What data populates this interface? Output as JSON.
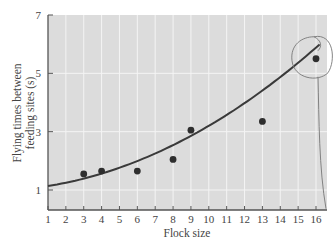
{
  "chart_data": {
    "type": "scatter",
    "title": "",
    "xlabel": "Flock size",
    "ylabel": "Flying times between feeding sites (s)",
    "ylabel_lines": [
      "Flying times between",
      "feeding sites (s)"
    ],
    "xlim": [
      1,
      16.6
    ],
    "ylim": [
      0.3,
      7
    ],
    "xticks": [
      1,
      2,
      3,
      4,
      5,
      6,
      7,
      8,
      9,
      10,
      11,
      12,
      13,
      14,
      15,
      16
    ],
    "yticks": [
      1,
      3,
      5,
      7
    ],
    "grid": true,
    "legend": null,
    "series": [
      {
        "name": "observations",
        "type": "scatter",
        "x": [
          3,
          4,
          6,
          8,
          9,
          13,
          16
        ],
        "y": [
          1.55,
          1.65,
          1.65,
          2.05,
          3.05,
          3.35,
          5.5
        ]
      },
      {
        "name": "fitted curve",
        "type": "line",
        "x": [
          1,
          4,
          8,
          12,
          16.2
        ],
        "y": [
          1.15,
          1.5,
          2.35,
          3.8,
          6.0
        ]
      }
    ],
    "annotations": [
      {
        "type": "hand-drawn circle",
        "around": [
          16,
          5.5
        ]
      }
    ]
  },
  "colors": {
    "plot_bg": "#dcdcdc",
    "grid": "#f4f4f4",
    "line": "#3a3a3a",
    "points": "#2e2e2e",
    "annotation": "#777777"
  }
}
